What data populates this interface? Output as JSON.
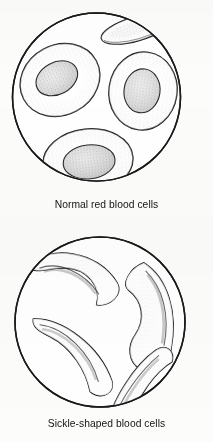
{
  "figure": {
    "background_color": "#fcfcfb",
    "ink_color": "#1a1a1a",
    "stipple_color": "#6d6d6d"
  },
  "panels": [
    {
      "id": "normal",
      "caption": "Normal red blood cells",
      "field_shape": "circle",
      "field": {
        "cx": 96.5,
        "cy": 97,
        "r": 84
      },
      "cell_count": 4,
      "cell_shape": "biconcave-disc",
      "cells": [
        {
          "name": "cell-upper-left",
          "cx": 60,
          "cy": 80,
          "rx": 40,
          "ry": 34,
          "rotate": -28,
          "dimple_rx": 21,
          "dimple_ry": 15
        },
        {
          "name": "cell-right",
          "cx": 142,
          "cy": 91,
          "rx": 33,
          "ry": 38,
          "rotate": 8,
          "dimple_rx": 17,
          "dimple_ry": 21
        },
        {
          "name": "cell-bottom",
          "cx": 88,
          "cy": 161,
          "rx": 44,
          "ry": 31,
          "rotate": -6,
          "dimple_rx": 25,
          "dimple_ry": 16
        },
        {
          "name": "cell-top-edge-on",
          "cx": 136,
          "cy": 29,
          "rx": 33,
          "ry": 11,
          "rotate": -16,
          "dimple_rx": 0,
          "dimple_ry": 0
        }
      ]
    },
    {
      "id": "sickle",
      "caption": "Sickle-shaped blood cells",
      "field_shape": "circle",
      "field": {
        "cx": 100,
        "cy": 101,
        "r": 85
      },
      "cell_count": 4,
      "cell_shape": "crescent-sickle",
      "cells": [
        {
          "name": "sickle-upper-left",
          "rotate": -12,
          "cx": 76,
          "cy": 59
        },
        {
          "name": "sickle-right-vertical",
          "rotate": 0,
          "cx": 147,
          "cy": 96
        },
        {
          "name": "sickle-lower-left",
          "rotate": 26,
          "cx": 74,
          "cy": 136
        },
        {
          "name": "sickle-bottom-right",
          "rotate": -28,
          "cx": 143,
          "cy": 166
        }
      ]
    }
  ]
}
